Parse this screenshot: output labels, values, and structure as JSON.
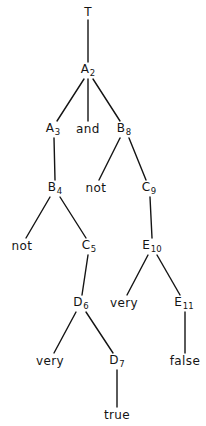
{
  "figure": {
    "kind": "parse-tree-diagram",
    "width": 206,
    "height": 426,
    "background_color": "#ffffff",
    "ink_color": "#141414"
  },
  "nodes": [
    {
      "id": "T",
      "label": "T",
      "base": "T",
      "sub": "",
      "kind": "nonterminal",
      "x": 88,
      "y": 12
    },
    {
      "id": "A2",
      "label": "A2",
      "base": "A",
      "sub": "2",
      "kind": "nonterminal",
      "x": 88,
      "y": 70
    },
    {
      "id": "A3",
      "label": "A3",
      "base": "A",
      "sub": "3",
      "kind": "nonterminal",
      "x": 53,
      "y": 129
    },
    {
      "id": "and",
      "label": "and",
      "base": "and",
      "sub": "",
      "kind": "terminal",
      "x": 88,
      "y": 129
    },
    {
      "id": "B8",
      "label": "B8",
      "base": "B",
      "sub": "8",
      "kind": "nonterminal",
      "x": 124,
      "y": 129
    },
    {
      "id": "B4",
      "label": "B4",
      "base": "B",
      "sub": "4",
      "kind": "nonterminal",
      "x": 55,
      "y": 188
    },
    {
      "id": "not1",
      "label": "not",
      "base": "not",
      "sub": "",
      "kind": "terminal",
      "x": 96,
      "y": 188
    },
    {
      "id": "C9",
      "label": "C9",
      "base": "C",
      "sub": "9",
      "kind": "nonterminal",
      "x": 149,
      "y": 188
    },
    {
      "id": "not2",
      "label": "not",
      "base": "not",
      "sub": "",
      "kind": "terminal",
      "x": 22,
      "y": 246
    },
    {
      "id": "C5",
      "label": "C5",
      "base": "C",
      "sub": "5",
      "kind": "nonterminal",
      "x": 89,
      "y": 246
    },
    {
      "id": "E10",
      "label": "E10",
      "base": "E",
      "sub": "10",
      "kind": "nonterminal",
      "x": 152,
      "y": 246
    },
    {
      "id": "D6",
      "label": "D6",
      "base": "D",
      "sub": "6",
      "kind": "nonterminal",
      "x": 81,
      "y": 303
    },
    {
      "id": "very1",
      "label": "very",
      "base": "very",
      "sub": "",
      "kind": "terminal",
      "x": 124,
      "y": 303
    },
    {
      "id": "E11",
      "label": "E11",
      "base": "E",
      "sub": "11",
      "kind": "nonterminal",
      "x": 184,
      "y": 303
    },
    {
      "id": "very2",
      "label": "very",
      "base": "very",
      "sub": "",
      "kind": "terminal",
      "x": 50,
      "y": 361
    },
    {
      "id": "D7",
      "label": "D7",
      "base": "D",
      "sub": "7",
      "kind": "nonterminal",
      "x": 117,
      "y": 361
    },
    {
      "id": "false",
      "label": "false",
      "base": "false",
      "sub": "",
      "kind": "terminal",
      "x": 185,
      "y": 361
    },
    {
      "id": "true",
      "label": "true",
      "base": "true",
      "sub": "",
      "kind": "terminal",
      "x": 117,
      "y": 415
    }
  ],
  "edges": [
    {
      "from": "T",
      "to": "A2",
      "x1": 88,
      "y1": 20,
      "x2": 88,
      "y2": 62
    },
    {
      "from": "A2",
      "to": "A3",
      "x1": 84,
      "y1": 79,
      "x2": 57,
      "y2": 121
    },
    {
      "from": "A2",
      "to": "and",
      "x1": 88,
      "y1": 79,
      "x2": 88,
      "y2": 121
    },
    {
      "from": "A2",
      "to": "B8",
      "x1": 93,
      "y1": 79,
      "x2": 120,
      "y2": 121
    },
    {
      "from": "A3",
      "to": "B4",
      "x1": 54,
      "y1": 138,
      "x2": 55,
      "y2": 180
    },
    {
      "from": "B8",
      "to": "not1",
      "x1": 120,
      "y1": 138,
      "x2": 99,
      "y2": 180
    },
    {
      "from": "B8",
      "to": "C9",
      "x1": 129,
      "y1": 138,
      "x2": 146,
      "y2": 180
    },
    {
      "from": "B4",
      "to": "not2",
      "x1": 50,
      "y1": 197,
      "x2": 26,
      "y2": 238
    },
    {
      "from": "B4",
      "to": "C5",
      "x1": 60,
      "y1": 197,
      "x2": 86,
      "y2": 238
    },
    {
      "from": "C9",
      "to": "E10",
      "x1": 150,
      "y1": 197,
      "x2": 152,
      "y2": 238
    },
    {
      "from": "C5",
      "to": "D6",
      "x1": 88,
      "y1": 255,
      "x2": 82,
      "y2": 295
    },
    {
      "from": "E10",
      "to": "very1",
      "x1": 148,
      "y1": 255,
      "x2": 127,
      "y2": 295
    },
    {
      "from": "E10",
      "to": "E11",
      "x1": 157,
      "y1": 255,
      "x2": 180,
      "y2": 295
    },
    {
      "from": "D6",
      "to": "very2",
      "x1": 76,
      "y1": 312,
      "x2": 54,
      "y2": 353
    },
    {
      "from": "D6",
      "to": "D7",
      "x1": 86,
      "y1": 312,
      "x2": 113,
      "y2": 353
    },
    {
      "from": "E11",
      "to": "false",
      "x1": 185,
      "y1": 312,
      "x2": 185,
      "y2": 353
    },
    {
      "from": "D7",
      "to": "true",
      "x1": 117,
      "y1": 370,
      "x2": 117,
      "y2": 407
    }
  ]
}
